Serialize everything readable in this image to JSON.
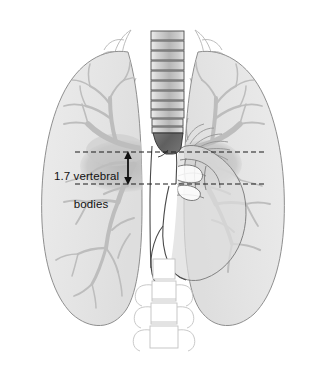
{
  "figure": {
    "type": "anatomical-illustration",
    "width": 326,
    "height": 365,
    "background_color": "#ffffff"
  },
  "annotation": {
    "measurement_label_line_1": "1.7 vertebral",
    "measurement_label_line_2": "bodies",
    "measurement_value": "1.7",
    "measurement_unit": "vertebral bodies",
    "text_color": "#111111",
    "arrow_type": "double-headed-vertical",
    "arrow_x": 128,
    "arrow_top_y": 152,
    "arrow_bottom_y": 184,
    "dashed_line_top_y": 152,
    "dashed_line_bottom_y": 184,
    "dashed_line_x_start": 75,
    "dashed_line_x_end": 266,
    "dash_pattern": "5,3",
    "line_color": "#1a1a1a"
  },
  "structures": {
    "lung_left": {
      "name": "left lung field",
      "fill": "#e6e6e6",
      "stroke": "#8a8a8a"
    },
    "lung_right": {
      "name": "right lung field",
      "fill": "#e6e6e6",
      "stroke": "#8a8a8a"
    },
    "bronchial_tree": {
      "name": "bronchial and pulmonary vascular tree",
      "stroke": "#b8b8b8"
    },
    "hilar_shadow": {
      "name": "hilar shadow",
      "fill": "#c2c2c2"
    },
    "vertebral_column_upper": {
      "name": "thoracic vertebral bodies",
      "fill_light": "#e4e4e4",
      "fill_dark": "#b4b4b4",
      "stroke": "#4a4a4a",
      "segment_count": 11
    },
    "vertebral_column_lower": {
      "name": "lumbar vertebrae with transverse processes",
      "fill": "#ffffff",
      "stroke": "#bcbcbc",
      "segment_count": 3
    },
    "carina": {
      "name": "carina / subcarinal density",
      "fill": "#6d6d6d",
      "stroke": "#333333"
    },
    "mediastinum": {
      "name": "mediastinal strip",
      "fill": "#ffffff",
      "stroke": "#4a4a4a"
    },
    "heart": {
      "name": "cardiac silhouette",
      "fill": "#dddddd",
      "stroke": "#7d7d7d"
    },
    "aortic_arch": {
      "name": "aortic arch and great vessels",
      "stroke": "#8f8f8f"
    },
    "clavicles": {
      "name": "clavicles and first ribs",
      "stroke": "#b0b0b0"
    }
  }
}
